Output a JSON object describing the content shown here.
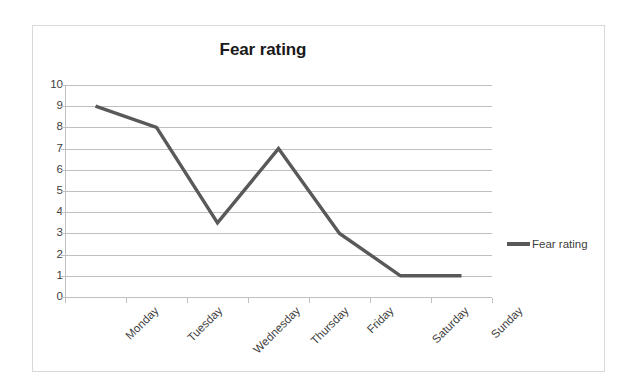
{
  "chart_data": {
    "type": "line",
    "title": "Fear rating",
    "xlabel": "",
    "ylabel": "",
    "categories": [
      "Monday",
      "Tuesday",
      "Wednesday",
      "Thursday",
      "Friday",
      "Saturday",
      "Sunday"
    ],
    "series": [
      {
        "name": "Fear rating",
        "values": [
          9,
          8,
          3.5,
          7,
          3,
          1,
          1
        ],
        "color": "#595959"
      }
    ],
    "ylim": [
      0,
      10
    ],
    "y_ticks": [
      10,
      9,
      8,
      7,
      6,
      5,
      4,
      3,
      2,
      1,
      0
    ],
    "grid": true,
    "legend_position": "right",
    "legend_entries": [
      "Fear rating"
    ]
  },
  "colors": {
    "series_line": "#595959",
    "gridline": "#bfbfbf",
    "frame_border": "#d9d9d9",
    "text": "#404040",
    "title_text": "#1a1a1a",
    "background": "#ffffff"
  }
}
